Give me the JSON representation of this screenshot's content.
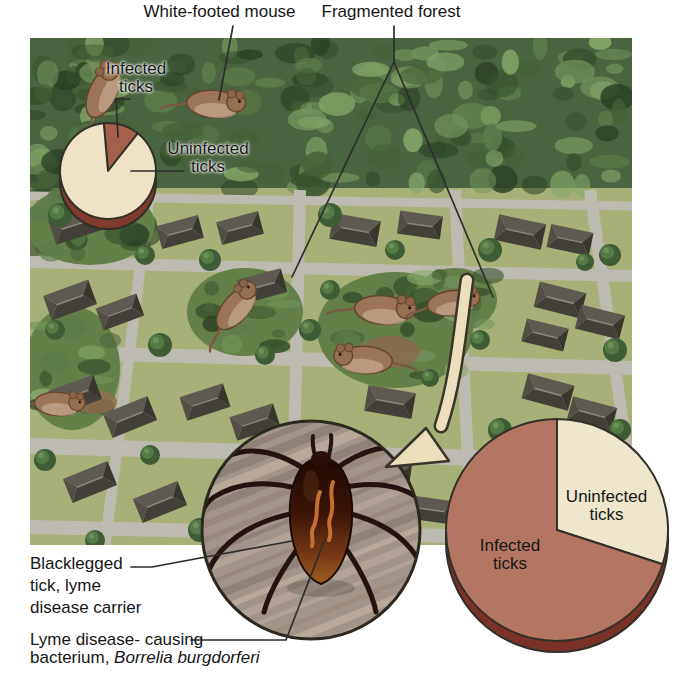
{
  "figure_labels": {
    "white_footed_mouse": "White-footed mouse",
    "fragmented_forest": "Fragmented forest",
    "small_pie": {
      "infected_line1": "Infected",
      "infected_line2": "ticks",
      "uninfected_line1": "Uninfected",
      "uninfected_line2": "ticks"
    },
    "large_pie": {
      "uninfected_line1": "Uninfected",
      "uninfected_line2": "ticks",
      "infected_line1": "Infected",
      "infected_line2": "ticks"
    },
    "captions": {
      "blacklegged_line1": "Blacklegged",
      "blacklegged_line2": "tick, lyme",
      "blacklegged_line3": "disease carrier",
      "lyme_line1": "Lyme disease- causing",
      "lyme_line2_roman": "bacterium,",
      "lyme_line2_italic": "Borrelia burgdorferi"
    }
  },
  "chart_data": [
    {
      "type": "pie",
      "position": "top-left-over-forest",
      "labels": [
        "Infected ticks",
        "Uninfected ticks"
      ],
      "values": [
        12,
        88
      ],
      "unit": "percent-estimated",
      "colors": [
        "#a5604a",
        "#eee3c6"
      ],
      "rim_color": "#813a2e",
      "start_angle_deg": -5,
      "clockwise": true,
      "label_placement": "outside",
      "layout": {
        "cx": 108,
        "cy": 171,
        "r": 48,
        "depth": 10
      }
    },
    {
      "type": "pie",
      "position": "bottom-right-over-suburb",
      "labels": [
        "Uninfected ticks",
        "Infected ticks"
      ],
      "values": [
        30,
        70
      ],
      "unit": "percent-estimated",
      "colors": [
        "#efe7cd",
        "#b47663"
      ],
      "rim_color": "#7d3229",
      "start_angle_deg": 0,
      "clockwise": true,
      "label_placement": "inside",
      "layout": {
        "cx": 557,
        "cy": 530,
        "r": 111,
        "depth": 11
      }
    }
  ],
  "palette": {
    "forest_green": "#4a6340",
    "lawn_green": "#a6b077",
    "road_gray": "#bdbab2",
    "roof_gray": "#4e4a43",
    "mouse_brown": "#9c7457",
    "tick_body_dark": "#3c1508",
    "bacterium_orange": "#c4702f",
    "arrow_cream": "#ebdfbd",
    "leader_line": "#2e2e2e"
  }
}
